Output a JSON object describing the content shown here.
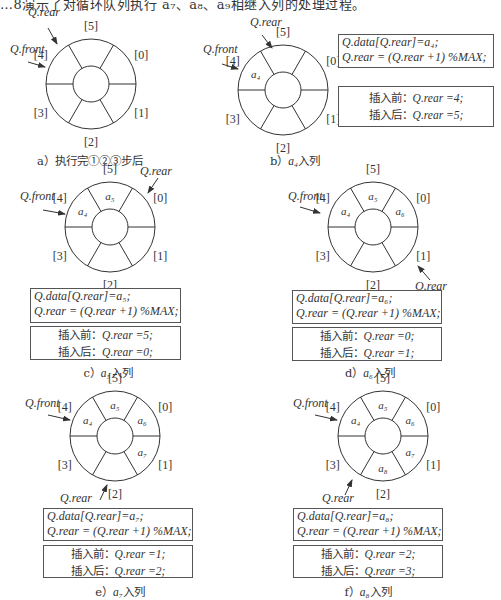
{
  "intro_text": "…8演示了对循环队列执行 a₇、a₈、a₉相继入列的处理过程。",
  "colors": {
    "line": "#333333",
    "text": "#2a2a2a",
    "background": "#ffffff"
  },
  "panels": [
    {
      "id": "a",
      "caption": "a）执行完①②③步后",
      "slots": [
        "",
        "",
        "",
        "",
        "",
        ""
      ],
      "rear_label": "Q.rear",
      "front_label": "Q.front"
    },
    {
      "id": "b",
      "caption_prefix": "b）",
      "caption_sym": "a₄",
      "caption_suffix": "入列",
      "slots": [
        "",
        "",
        "",
        "",
        "a₄",
        ""
      ],
      "rear_label": "Q.rear",
      "front_label": "Q.front",
      "code": [
        "Q.data[Q.rear]=a₄;",
        "Q.rear = (Q.rear +1) %MAX;"
      ],
      "before": {
        "label": "插入前：",
        "expr": "Q.rear =4;"
      },
      "after": {
        "label": "插入后：",
        "expr": "Q.rear =5;"
      }
    },
    {
      "id": "c",
      "caption_prefix": "c）",
      "caption_sym": "a₅",
      "caption_suffix": "入列",
      "slots": [
        "",
        "",
        "",
        "",
        "a₄",
        "a₅"
      ],
      "rear_label": "Q.rear",
      "front_label": "Q.front",
      "code": [
        "Q.data[Q.rear]=a₅;",
        "Q.rear = (Q.rear +1) %MAX;"
      ],
      "before": {
        "label": "插入前：",
        "expr": "Q.rear =5;"
      },
      "after": {
        "label": "插入后：",
        "expr": "Q.rear =0;"
      }
    },
    {
      "id": "d",
      "caption_prefix": "d）",
      "caption_sym": "a₆",
      "caption_suffix": "入列",
      "slots": [
        "a₆",
        "",
        "",
        "",
        "a₄",
        "a₅"
      ],
      "rear_label": "Q.rear",
      "front_label": "Q.front",
      "code": [
        "Q.data[Q.rear]=a₆;",
        "Q.rear = (Q.rear +1) %MAX;"
      ],
      "before": {
        "label": "插入前：",
        "expr": "Q.rear =0;"
      },
      "after": {
        "label": "插入后：",
        "expr": "Q.rear =1;"
      }
    },
    {
      "id": "e",
      "caption_prefix": "e）",
      "caption_sym": "a₇",
      "caption_suffix": "入列",
      "slots": [
        "a₆",
        "a₇",
        "",
        "",
        "a₄",
        "a₅"
      ],
      "rear_label": "Q.rear",
      "front_label": "Q.front",
      "code": [
        "Q.data[Q.rear]=a₇;",
        "Q.rear = (Q.rear +1) %MAX;"
      ],
      "before": {
        "label": "插入前：",
        "expr": "Q.rear =1;"
      },
      "after": {
        "label": "插入后：",
        "expr": "Q.rear =2;"
      }
    },
    {
      "id": "f",
      "caption_prefix": "f）",
      "caption_sym": "a₈",
      "caption_suffix": "入列",
      "slots": [
        "a₆",
        "a₇",
        "a₈",
        "",
        "a₄",
        "a₅"
      ],
      "rear_label": "Q.rear",
      "front_label": "Q.front",
      "code": [
        "Q.data[Q.rear]=a₈;",
        "Q.rear = (Q.rear +1) %MAX;"
      ],
      "before": {
        "label": "插入前：",
        "expr": "Q.rear =2;"
      },
      "after": {
        "label": "插入后：",
        "expr": "Q.rear =3;"
      }
    }
  ],
  "index_labels": [
    "[0]",
    "[1]",
    "[2]",
    "[3]",
    "[4]",
    "[5]"
  ]
}
